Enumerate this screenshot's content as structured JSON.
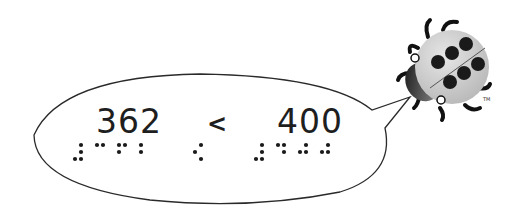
{
  "comparison": {
    "left_number": "362",
    "operator": "<",
    "right_number": "400"
  },
  "braille": {
    "left_number": {
      "cells": [
        {
          "name": "number-sign",
          "dots": [
            3,
            4,
            5,
            6
          ]
        },
        {
          "name": "3",
          "dots": [
            1,
            4
          ]
        },
        {
          "name": "6",
          "dots": [
            1,
            2,
            4
          ]
        },
        {
          "name": "2",
          "dots": [
            1,
            2
          ]
        }
      ]
    },
    "operator": {
      "cells": [
        {
          "name": "less-than",
          "dots": [
            2,
            4,
            6
          ]
        }
      ]
    },
    "right_number": {
      "cells": [
        {
          "name": "number-sign",
          "dots": [
            3,
            4,
            5,
            6
          ]
        },
        {
          "name": "4",
          "dots": [
            1,
            4,
            5
          ]
        },
        {
          "name": "0",
          "dots": [
            2,
            4,
            5
          ]
        },
        {
          "name": "0",
          "dots": [
            2,
            4,
            5
          ]
        }
      ]
    }
  },
  "mascot": {
    "type": "ladybug",
    "spots": 8,
    "trademark": "TM"
  },
  "colors": {
    "outline": "#2a2a2a",
    "text": "#1e1e1e",
    "ladybug_shell": "#c8c8c8",
    "ladybug_spots": "#1a1a1a"
  }
}
